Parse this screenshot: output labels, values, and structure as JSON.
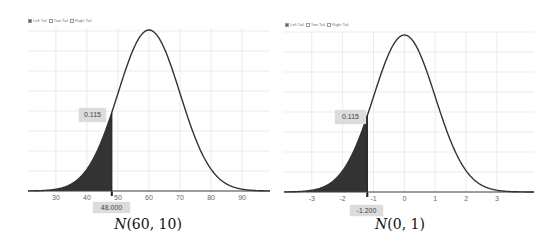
{
  "legend": {
    "options": [
      {
        "label": "Left Tail",
        "checked": true
      },
      {
        "label": "Two Tail",
        "checked": false
      },
      {
        "label": "Right Tail",
        "checked": false
      }
    ]
  },
  "charts": [
    {
      "caption_name": "N",
      "caption_params": "(60, 10)",
      "mean": 60,
      "sd": 10,
      "cutoff": 48,
      "cutoff_label": "48.000",
      "area_label": "0.115",
      "ticks": [
        "30",
        "40",
        "50",
        "60",
        "70",
        "80",
        "90"
      ]
    },
    {
      "caption_name": "N",
      "caption_params": "(0, 1)",
      "mean": 0,
      "sd": 1,
      "cutoff": -1.2,
      "cutoff_label": "-1.200",
      "area_label": "0.115",
      "ticks": [
        "-3",
        "-2",
        "-1",
        "0",
        "1",
        "2",
        "3"
      ]
    }
  ],
  "colors": {
    "curve": "#333333",
    "fill": "#333333",
    "grid": "#e6e6e6",
    "axis": "#444444",
    "tag_bg": "#dcdcdc"
  },
  "chart_data": [
    {
      "type": "area",
      "title": "N(60,10)",
      "xlabel": "",
      "ylabel": "",
      "distribution": "normal",
      "mean": 60,
      "sd": 10,
      "shaded_region": "left tail, x <= 48",
      "cutoff_x": 48.0,
      "shaded_probability": 0.115,
      "x_ticks": [
        30,
        40,
        50,
        60,
        70,
        80,
        90
      ],
      "xlim": [
        21,
        99
      ],
      "grid": true,
      "legend": [
        "Left Tail",
        "Two Tail",
        "Right Tail"
      ],
      "legend_selected": "Left Tail",
      "legend_position": "top-left"
    },
    {
      "type": "area",
      "title": "N(0,1)",
      "xlabel": "",
      "ylabel": "",
      "distribution": "normal",
      "mean": 0,
      "sd": 1,
      "shaded_region": "left tail, x <= -1.2",
      "cutoff_x": -1.2,
      "shaded_probability": 0.115,
      "x_ticks": [
        -3,
        -2,
        -1,
        0,
        1,
        2,
        3
      ],
      "xlim": [
        -3.9,
        4.2
      ],
      "grid": true,
      "legend": [
        "Left Tail",
        "Two Tail",
        "Right Tail"
      ],
      "legend_selected": "Left Tail",
      "legend_position": "top-left"
    }
  ]
}
